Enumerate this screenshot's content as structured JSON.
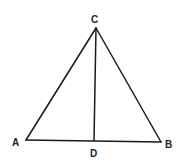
{
  "diagram": {
    "type": "geometry",
    "points": {
      "A": {
        "label": "A",
        "x": 26,
        "y": 140
      },
      "B": {
        "label": "B",
        "x": 161,
        "y": 142
      },
      "C": {
        "label": "C",
        "x": 96,
        "y": 28
      },
      "D": {
        "label": "D",
        "x": 94,
        "y": 141
      }
    },
    "segments": [
      [
        "A",
        "C"
      ],
      [
        "C",
        "B"
      ],
      [
        "A",
        "B"
      ],
      [
        "C",
        "D"
      ]
    ],
    "labels": {
      "A": "A",
      "B": "B",
      "C": "C",
      "D": "D"
    },
    "colors": {
      "line": "#1a1a1a",
      "text": "#222222",
      "background": "#ffffff"
    }
  }
}
